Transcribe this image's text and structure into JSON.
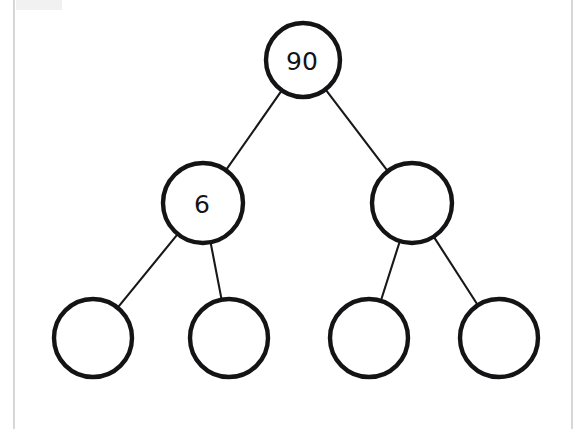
{
  "page": {
    "background_color": "#ffffff",
    "width": 583,
    "height": 429,
    "gutter_color": "#c9c9c9"
  },
  "diagram": {
    "type": "binary-tree",
    "stroke_color": "#141416",
    "fill_color": "#ffffff",
    "edge_color": "#18181a",
    "node_stroke_width": 4.4,
    "edge_stroke_width": 2.1,
    "levels": 3,
    "node_count": 7,
    "filled_node_count": 2,
    "empty_node_count": 5,
    "nodes": [
      {
        "id": "root",
        "label": "90",
        "level": 0,
        "index": 0,
        "cx": 303,
        "cy": 60,
        "r": 37,
        "filled": true
      },
      {
        "id": "l1-0",
        "label": "6",
        "level": 1,
        "index": 0,
        "cx": 203,
        "cy": 203,
        "r": 40,
        "filled": true
      },
      {
        "id": "l1-1",
        "label": "",
        "level": 1,
        "index": 1,
        "cx": 412,
        "cy": 203,
        "r": 40,
        "filled": false
      },
      {
        "id": "l2-0",
        "label": "",
        "level": 2,
        "index": 0,
        "cx": 93,
        "cy": 338,
        "r": 39,
        "filled": false
      },
      {
        "id": "l2-1",
        "label": "",
        "level": 2,
        "index": 1,
        "cx": 229,
        "cy": 338,
        "r": 39,
        "filled": false
      },
      {
        "id": "l2-2",
        "label": "",
        "level": 2,
        "index": 2,
        "cx": 369,
        "cy": 338,
        "r": 39,
        "filled": false
      },
      {
        "id": "l2-3",
        "label": "",
        "level": 2,
        "index": 3,
        "cx": 499,
        "cy": 338,
        "r": 39,
        "filled": false
      }
    ],
    "edges": [
      {
        "id": "e0",
        "from": "root",
        "to": "l1-0"
      },
      {
        "id": "e1",
        "from": "root",
        "to": "l1-1"
      },
      {
        "id": "e2",
        "from": "l1-0",
        "to": "l2-0"
      },
      {
        "id": "e3",
        "from": "l1-0",
        "to": "l2-1"
      },
      {
        "id": "e4",
        "from": "l1-1",
        "to": "l2-2"
      },
      {
        "id": "e5",
        "from": "l1-1",
        "to": "l2-3"
      }
    ]
  }
}
